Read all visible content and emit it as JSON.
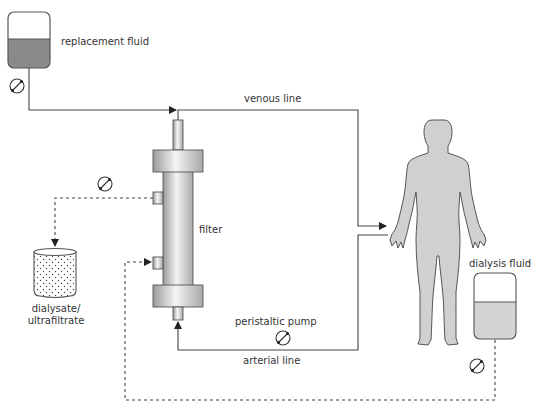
{
  "diagram": {
    "labels": {
      "replacement_fluid": "replacement fluid",
      "venous_line": "venous line",
      "filter": "filter",
      "dialysate_line1": "dialysate/",
      "dialysate_line2": "ultrafiltrate",
      "peristaltic_pump": "peristaltic pump",
      "arterial_line": "arterial line",
      "dialysis_fluid": "dialysis fluid"
    },
    "components": [
      {
        "id": "replacement-fluid-bag",
        "type": "fluid-bag",
        "label": "replacement fluid"
      },
      {
        "id": "replacement-pump",
        "type": "pump-icon"
      },
      {
        "id": "filter",
        "type": "hemofilter",
        "label": "filter"
      },
      {
        "id": "ultrafiltrate-pump",
        "type": "pump-icon"
      },
      {
        "id": "dialysate-container",
        "type": "collection-container",
        "label": "dialysate/ ultrafiltrate"
      },
      {
        "id": "patient",
        "type": "human-figure"
      },
      {
        "id": "peristaltic-pump",
        "type": "pump-icon",
        "label": "peristaltic pump"
      },
      {
        "id": "dialysis-fluid-bag",
        "type": "fluid-bag",
        "label": "dialysis fluid"
      },
      {
        "id": "dialysis-fluid-pump",
        "type": "pump-icon"
      }
    ],
    "colors": {
      "line": "#333333",
      "fluid": "#8a8a8a",
      "light_fluid": "#d4d4d4",
      "body": "#d0d0d0",
      "body_outline": "#555555"
    }
  }
}
